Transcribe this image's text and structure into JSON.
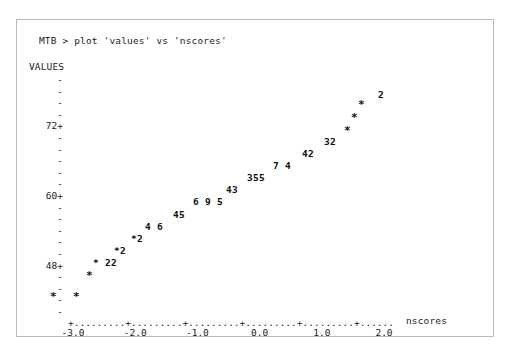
{
  "window": {
    "frame_border_color": "#b9b9b9",
    "background": "#ffffff",
    "text_color": "#1b1b1b"
  },
  "command_line": {
    "text": "MTB > plot 'values' vs 'nscores'"
  },
  "chart_data": {
    "type": "scatter",
    "title": "",
    "subtitle": "",
    "ylabel": "VALUES",
    "xlabel": "nscores",
    "xlim": [
      -3.4,
      2.8
    ],
    "ylim": [
      42.0,
      81.0
    ],
    "grid": false,
    "legend": null,
    "style": "ascii-character-plot",
    "y_axis": {
      "label": "VALUES",
      "labeled_ticks": [
        "72+",
        "60+",
        "48+"
      ],
      "labeled_tick_values": [
        72,
        60,
        48
      ],
      "minor_tick_glyph": "-",
      "tick_step": 2,
      "ticks": [
        {
          "value": 80,
          "label": "-"
        },
        {
          "value": 78,
          "label": "-"
        },
        {
          "value": 76,
          "label": "-"
        },
        {
          "value": 74,
          "label": "-"
        },
        {
          "value": 72,
          "label": "72+"
        },
        {
          "value": 70,
          "label": "-"
        },
        {
          "value": 68,
          "label": "-"
        },
        {
          "value": 66,
          "label": "-"
        },
        {
          "value": 64,
          "label": "-"
        },
        {
          "value": 62,
          "label": "-"
        },
        {
          "value": 60,
          "label": "60+"
        },
        {
          "value": 58,
          "label": "-"
        },
        {
          "value": 56,
          "label": "-"
        },
        {
          "value": 54,
          "label": "-"
        },
        {
          "value": 52,
          "label": "-"
        },
        {
          "value": 50,
          "label": "-"
        },
        {
          "value": 48,
          "label": "48+"
        },
        {
          "value": 46,
          "label": "-"
        },
        {
          "value": 44,
          "label": "-"
        },
        {
          "value": 42,
          "label": "-"
        },
        {
          "value": 40,
          "label": "-"
        }
      ]
    },
    "x_axis": {
      "label": "nscores",
      "tick_labels": [
        "-3.0",
        "-2.0",
        "-1.0",
        "0.0",
        "1.0",
        "2.0"
      ],
      "tick_values": [
        -3.0,
        -2.0,
        -1.0,
        0.0,
        1.0,
        2.0
      ],
      "axis_glyph": "+--------+--------+--------+--------+--------+",
      "axis_render": "+.........+.........+.........+.........+.........+......"
    },
    "markers": [
      {
        "glyph": "*",
        "x": -2.38,
        "y": 44.1,
        "count": 1
      },
      {
        "glyph": "*",
        "x": -2.0,
        "y": 44.1,
        "count": 1
      },
      {
        "glyph": "*",
        "x": -1.78,
        "y": 46.6,
        "count": 1
      },
      {
        "glyph": "*",
        "x": -1.64,
        "y": 48.3,
        "count": 1
      },
      {
        "glyph": "2",
        "x": -1.45,
        "y": 48.3,
        "count": 2
      },
      {
        "glyph": "2",
        "x": -1.39,
        "y": 48.3,
        "count": 2
      },
      {
        "glyph": "*",
        "x": -1.3,
        "y": 50.1,
        "count": 1
      },
      {
        "glyph": "2",
        "x": -1.22,
        "y": 50.1,
        "count": 2
      },
      {
        "glyph": "*",
        "x": -1.1,
        "y": 51.7,
        "count": 1
      },
      {
        "glyph": "2",
        "x": -1.02,
        "y": 51.7,
        "count": 2
      },
      {
        "glyph": "4",
        "x": -0.86,
        "y": 53.4,
        "count": 4
      },
      {
        "glyph": "6",
        "x": -0.71,
        "y": 53.4,
        "count": 6
      },
      {
        "glyph": "4",
        "x": -0.48,
        "y": 55.1,
        "count": 4
      },
      {
        "glyph": "5",
        "x": -0.41,
        "y": 55.1,
        "count": 5
      },
      {
        "glyph": "6",
        "x": -0.21,
        "y": 56.9,
        "count": 6
      },
      {
        "glyph": "9",
        "x": -0.06,
        "y": 56.9,
        "count": 9
      },
      {
        "glyph": "5",
        "x": 0.08,
        "y": 56.9,
        "count": 5
      },
      {
        "glyph": "4",
        "x": 0.24,
        "y": 58.6,
        "count": 4
      },
      {
        "glyph": "3",
        "x": 0.32,
        "y": 58.6,
        "count": 3
      },
      {
        "glyph": "3",
        "x": 0.48,
        "y": 60.4,
        "count": 3
      },
      {
        "glyph": "5",
        "x": 0.56,
        "y": 60.4,
        "count": 5
      },
      {
        "glyph": "5",
        "x": 0.64,
        "y": 60.4,
        "count": 5
      },
      {
        "glyph": "7",
        "x": 0.85,
        "y": 62.1,
        "count": 7
      },
      {
        "glyph": "4",
        "x": 0.99,
        "y": 62.1,
        "count": 4
      },
      {
        "glyph": "4",
        "x": 1.17,
        "y": 63.8,
        "count": 4
      },
      {
        "glyph": "2",
        "x": 1.25,
        "y": 63.8,
        "count": 2
      },
      {
        "glyph": "3",
        "x": 1.47,
        "y": 65.6,
        "count": 3
      },
      {
        "glyph": "2",
        "x": 1.55,
        "y": 65.6,
        "count": 2
      },
      {
        "glyph": "*",
        "x": 1.76,
        "y": 68.0,
        "count": 1
      },
      {
        "glyph": "*",
        "x": 1.87,
        "y": 70.0,
        "count": 1
      },
      {
        "glyph": "*",
        "x": 1.98,
        "y": 72.0,
        "count": 1
      },
      {
        "glyph": "2",
        "x": 2.27,
        "y": 73.7,
        "count": 2
      }
    ],
    "marker_rows": [
      {
        "label": "2",
        "left": 361,
        "top": 70
      },
      {
        "label": "*",
        "left": 341,
        "top": 80
      },
      {
        "label": "*",
        "left": 334,
        "top": 93
      },
      {
        "label": "*",
        "left": 327,
        "top": 106
      },
      {
        "label": "32",
        "left": 307,
        "top": 117
      },
      {
        "label": "42",
        "left": 285,
        "top": 129
      },
      {
        "label": "7 4",
        "left": 256,
        "top": 141
      },
      {
        "label": "355",
        "left": 230,
        "top": 153
      },
      {
        "label": "43",
        "left": 209,
        "top": 165
      },
      {
        "label": "6 9 5",
        "left": 176,
        "top": 177
      },
      {
        "label": "45",
        "left": 156,
        "top": 190
      },
      {
        "label": "4 6",
        "left": 128,
        "top": 202
      },
      {
        "label": "*2",
        "left": 114,
        "top": 214
      },
      {
        "label": "*2",
        "left": 97,
        "top": 226
      },
      {
        "label": "* 22",
        "left": 76,
        "top": 238
      },
      {
        "label": "*",
        "left": 69,
        "top": 251
      },
      {
        "label": "*",
        "left": 33,
        "top": 272
      },
      {
        "label": "*",
        "left": 56,
        "top": 272
      }
    ],
    "value_counts_summary": {
      "total_observations": 115,
      "single_star_points": 9,
      "note": "digits encode number of overlapping observations at that cell"
    }
  }
}
